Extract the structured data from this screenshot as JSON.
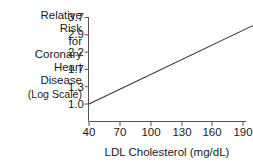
{
  "chart_data": {
    "type": "line",
    "title": "",
    "subtitle": "",
    "xlabel": "LDL Cholesterol (mg/dL)",
    "ylabel": "Relative Risk for Coronary Heart Disease (Log Scale)",
    "ylabel_lines": [
      "Relative",
      "Risk",
      "for",
      "Coronary",
      "Heart",
      "Disease",
      "(Log Scale)"
    ],
    "xticks": [
      40,
      70,
      100,
      130,
      160,
      190
    ],
    "xtick_labels": [
      "40",
      "70",
      "100",
      "130",
      "160",
      "190"
    ],
    "yticks": [
      1.0,
      1.3,
      1.7,
      2.2,
      2.9,
      3.7
    ],
    "ytick_labels": [
      "1.0",
      "1.3",
      "1.7",
      "2.2",
      "2.9",
      "3.7"
    ],
    "yscale": "log",
    "xscale": "linear",
    "xlim": [
      40,
      205
    ],
    "ylim": [
      1.0,
      3.9
    ],
    "grid": false,
    "legend": null,
    "line_color": "#333333",
    "axis_color": "#555555",
    "series": [
      {
        "name": "Relative risk of coronary heart disease",
        "x": [
          40,
          70,
          100,
          130,
          160,
          190,
          205
        ],
        "y": [
          1.0,
          1.25,
          1.56,
          1.95,
          2.44,
          3.05,
          3.41
        ]
      }
    ],
    "annotations": []
  },
  "axis": {
    "ytick_label_0": "3.7",
    "ytick_label_1": "2.9",
    "ytick_label_2": "2.2",
    "ytick_label_3": "1.7",
    "ytick_label_4": "1.3",
    "ytick_label_5": "1.0",
    "xtick_label_0": "40",
    "xtick_label_1": "70",
    "xtick_label_2": "100",
    "xtick_label_3": "130",
    "xtick_label_4": "160",
    "xtick_label_5": "190"
  },
  "ylabel_lines": {
    "l0": "Relative",
    "l1": "Risk",
    "l2": "for",
    "l3": "Coronary",
    "l4": "Heart",
    "l5": "Disease",
    "l6": "(Log Scale)"
  },
  "xlabel": {
    "text": "LDL Cholesterol (mg/dL)"
  },
  "colors": {
    "background": "#ffffff",
    "line": "#333333",
    "axis": "#555555",
    "text": "#1a1a1a"
  }
}
